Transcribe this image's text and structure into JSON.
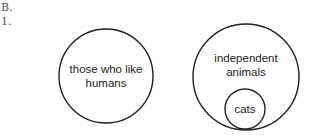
{
  "header": {
    "section": "B.",
    "item": "1."
  },
  "diagram": {
    "left_circle": {
      "line1": "those who like",
      "line2": "humans"
    },
    "right_circle": {
      "line1": "independent",
      "line2": "animals"
    },
    "inner_circle": {
      "label": "cats"
    }
  }
}
